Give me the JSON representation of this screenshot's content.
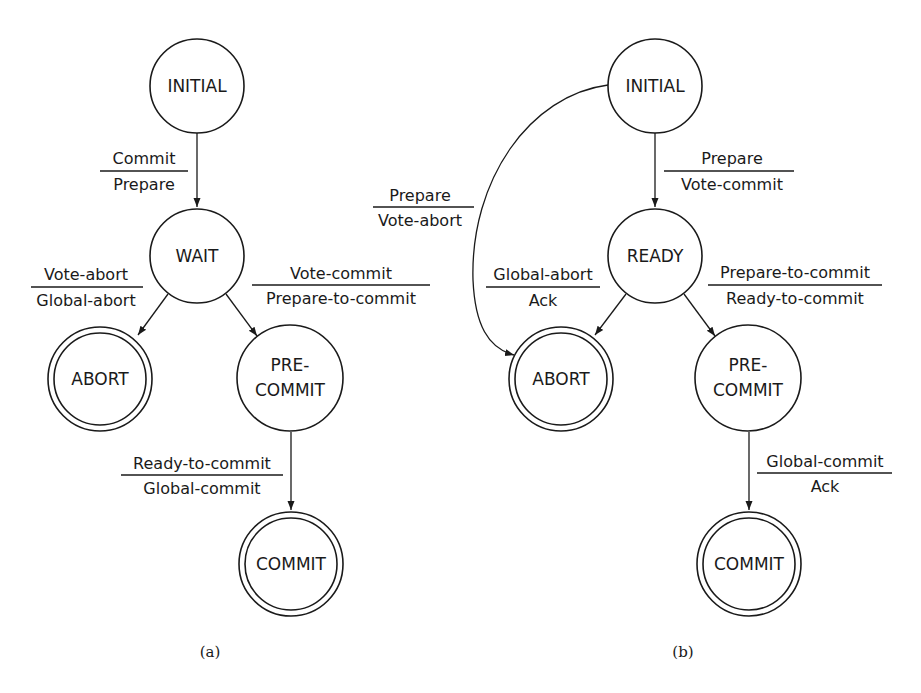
{
  "diagram_a": {
    "caption": "(a)",
    "states": {
      "initial": "INITIAL",
      "wait": "WAIT",
      "abort": "ABORT",
      "precommit_1": "PRE-",
      "precommit_2": "COMMIT",
      "commit": "COMMIT"
    },
    "transitions": {
      "initial_wait": {
        "input": "Commit",
        "output": "Prepare"
      },
      "wait_abort": {
        "input": "Vote-abort",
        "output": "Global-abort"
      },
      "wait_precommit": {
        "input": "Vote-commit",
        "output": "Prepare-to-commit"
      },
      "precommit_commit": {
        "input": "Ready-to-commit",
        "output": "Global-commit"
      }
    }
  },
  "diagram_b": {
    "caption": "(b)",
    "states": {
      "initial": "INITIAL",
      "ready": "READY",
      "abort": "ABORT",
      "precommit_1": "PRE-",
      "precommit_2": "COMMIT",
      "commit": "COMMIT"
    },
    "transitions": {
      "initial_ready": {
        "input": "Prepare",
        "output": "Vote-commit"
      },
      "initial_abort": {
        "input": "Prepare",
        "output": "Vote-abort"
      },
      "ready_abort": {
        "input": "Global-abort",
        "output": "Ack"
      },
      "ready_precommit": {
        "input": "Prepare-to-commit",
        "output": "Ready-to-commit"
      },
      "precommit_commit": {
        "input": "Global-commit",
        "output": "Ack"
      }
    }
  }
}
